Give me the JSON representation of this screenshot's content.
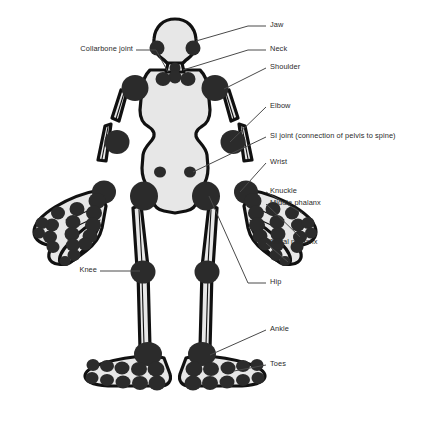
{
  "diagram": {
    "colors": {
      "background": "#ffffff",
      "body_fill": "#e7e7e7",
      "outline": "#111111",
      "joint": "#2b2b2b",
      "label_text": "#2a2a2a",
      "leader_line": "#4a4a4a"
    }
  },
  "labels": {
    "right": [
      {
        "id": "jaw",
        "text": "Jaw",
        "x": 270,
        "y": 23,
        "line": {
          "x1": 268,
          "y1": 27,
          "x2": 204,
          "y2": 38
        }
      },
      {
        "id": "neck",
        "text": "Neck",
        "x": 270,
        "y": 47,
        "line": {
          "x1": 268,
          "y1": 51,
          "x2": 186,
          "y2": 68
        }
      },
      {
        "id": "shoulder",
        "text": "Shoulder",
        "x": 270,
        "y": 65,
        "line": {
          "x1": 268,
          "y1": 69,
          "x2": 215,
          "y2": 86
        }
      },
      {
        "id": "elbow",
        "text": "Elbow",
        "x": 270,
        "y": 104,
        "line": {
          "x1": 268,
          "y1": 108,
          "x2": 222,
          "y2": 112
        }
      },
      {
        "id": "si-joint",
        "text": "SI joint (connection of pelvis to spine)",
        "x": 270,
        "y": 134,
        "line": {
          "x1": 268,
          "y1": 138,
          "x2": 196,
          "y2": 137
        }
      },
      {
        "id": "wrist",
        "text": "Wrist",
        "x": 270,
        "y": 160,
        "line": {
          "x1": 268,
          "y1": 164,
          "x2": 234,
          "y2": 160
        }
      },
      {
        "id": "knuckle",
        "text": "Knuckle",
        "x": 270,
        "y": 189,
        "line": {
          "x1": 268,
          "y1": 193,
          "x2": 268,
          "y2": 193
        }
      },
      {
        "id": "middle-phalanx",
        "text": "Middle phalanx",
        "x": 270,
        "y": 201,
        "line": {
          "x1": 268,
          "y1": 205,
          "x2": 268,
          "y2": 205
        }
      },
      {
        "id": "distal-phalanx",
        "text": "Distal phalanx",
        "x": 270,
        "y": 240,
        "line": {
          "x1": 268,
          "y1": 244,
          "x2": 268,
          "y2": 244
        }
      },
      {
        "id": "hip",
        "text": "Hip",
        "x": 270,
        "y": 280,
        "line": {
          "x1": 268,
          "y1": 284,
          "x2": 212,
          "y2": 198
        }
      },
      {
        "id": "ankle",
        "text": "Ankle",
        "x": 270,
        "y": 327,
        "line": {
          "x1": 268,
          "y1": 331,
          "x2": 188,
          "y2": 350
        }
      },
      {
        "id": "toes",
        "text": "Toes",
        "x": 270,
        "y": 362,
        "line": {
          "x1": 268,
          "y1": 366,
          "x2": 232,
          "y2": 374
        }
      }
    ],
    "left": [
      {
        "id": "collarbone-joint",
        "text": "Collarbone joint",
        "x": 58,
        "y": 47,
        "line": {
          "x1": 140,
          "y1": 51,
          "x2": 168,
          "y2": 66
        }
      },
      {
        "id": "knee",
        "text": "Knee",
        "x": 78,
        "y": 268,
        "line": {
          "x1": 103,
          "y1": 272,
          "x2": 143,
          "y2": 272
        }
      }
    ]
  },
  "figure_parts": [
    {
      "id": "head",
      "name": "head"
    },
    {
      "id": "jaw-joints",
      "name": "jaw joints"
    },
    {
      "id": "neck-joints",
      "name": "neck joints"
    },
    {
      "id": "torso",
      "name": "torso and pelvis"
    },
    {
      "id": "shoulder-joints",
      "name": "shoulder joints"
    },
    {
      "id": "collarbone-joints",
      "name": "collarbone joints"
    },
    {
      "id": "arms",
      "name": "arms"
    },
    {
      "id": "elbow-joints",
      "name": "elbow joints"
    },
    {
      "id": "wrist-joints",
      "name": "wrist joints"
    },
    {
      "id": "hands",
      "name": "hands with finger joints"
    },
    {
      "id": "si-joints",
      "name": "SI joints"
    },
    {
      "id": "hip-joints",
      "name": "hip joints"
    },
    {
      "id": "legs",
      "name": "legs"
    },
    {
      "id": "knee-joints",
      "name": "knee joints"
    },
    {
      "id": "ankle-joints",
      "name": "ankle joints"
    },
    {
      "id": "feet",
      "name": "feet with toe joints"
    }
  ]
}
